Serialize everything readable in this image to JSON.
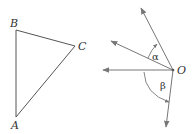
{
  "triangle": {
    "vertices": {
      "A": {
        "label": "A",
        "x": 16,
        "y": 117
      },
      "B": {
        "label": "B",
        "x": 16,
        "y": 30
      },
      "C": {
        "label": "C",
        "x": 75,
        "y": 46
      }
    }
  },
  "rays": {
    "origin": {
      "label": "O",
      "x": 173,
      "y": 70
    },
    "directions": [
      {
        "name": "ray-up",
        "x": 141,
        "y": 8
      },
      {
        "name": "ray-upper-left",
        "x": 111,
        "y": 41
      },
      {
        "name": "ray-left",
        "x": 103,
        "y": 70
      },
      {
        "name": "ray-down",
        "x": 166,
        "y": 127
      }
    ],
    "angles": [
      {
        "label": "α",
        "between": [
          "ray-upper-left",
          "ray-up"
        ]
      },
      {
        "label": "β",
        "between": [
          "ray-left",
          "ray-down"
        ]
      }
    ]
  },
  "colors": {
    "line": "#555555",
    "arrow": "#777777",
    "text": "#333333"
  }
}
